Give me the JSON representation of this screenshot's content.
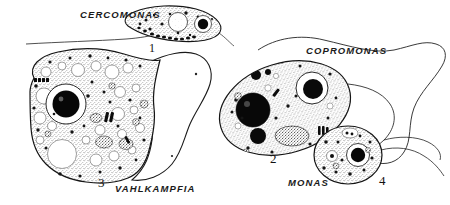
{
  "figure": {
    "background_color": "#ffffff",
    "ink_color": "#111111",
    "stipple_color": "#2b2b2b"
  },
  "organisms": [
    {
      "id": "cercomonas",
      "label": "CERCOMONAS",
      "number": "1",
      "label_x": 80,
      "label_y": 14,
      "number_x": 148,
      "number_y": 50,
      "shape": "elongated teardrop flagellate",
      "features": [
        "anterior clear vacuole",
        "dark round nucleus",
        "long trailing flagellum",
        "row of dark granules along ventral edge"
      ]
    },
    {
      "id": "copromonas",
      "label": "COPROMONAS",
      "number": "2",
      "label_x": 310,
      "label_y": 52,
      "number_x": 273,
      "number_y": 160,
      "shape": "large oval flagellate",
      "features": [
        "large solid black nucleus left",
        "clear vacuole with dark body right",
        "dense granular mass",
        "long looping flagellum to right margin"
      ]
    },
    {
      "id": "vahlkampfia",
      "label": "VAHLKAMPFIA",
      "number": "3",
      "label_x": 118,
      "label_y": 190,
      "number_x": 101,
      "number_y": 184,
      "shape": "large amoeba with hyaline pseudopod",
      "features": [
        "central black nucleus in clear halo",
        "many food vacuoles",
        "clear hyaline lobe at right",
        "dense cytoplasmic granules"
      ]
    },
    {
      "id": "monas",
      "label": "MONAS",
      "number": "4",
      "label_x": 290,
      "label_y": 180,
      "number_x": 381,
      "number_y": 182,
      "shape": "small rounded flagellate",
      "features": [
        "dark nucleus in clear halo",
        "scattered granules",
        "short flagellum"
      ]
    }
  ],
  "flagella": [
    {
      "name": "cercomonas-trailing-flagellum",
      "from": "cercomonas",
      "direction": "left"
    },
    {
      "name": "copromonas-anterior-flagellum",
      "from": "copromonas",
      "direction": "upper-right-loop"
    },
    {
      "name": "monas-flagellum",
      "from": "monas",
      "direction": "right"
    }
  ]
}
